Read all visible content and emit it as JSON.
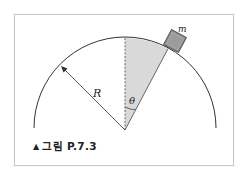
{
  "figure": {
    "caption_marker": "▲",
    "caption": "그림 P.7.3"
  },
  "labels": {
    "radius": "R",
    "angle": "θ",
    "mass": "m"
  },
  "colors": {
    "arc": "#333333",
    "wedge_fill": "#d9d9d9",
    "block_fill": "#8a8a8a",
    "block_edge": "#444444",
    "frame_border": "#c8c8c8"
  }
}
